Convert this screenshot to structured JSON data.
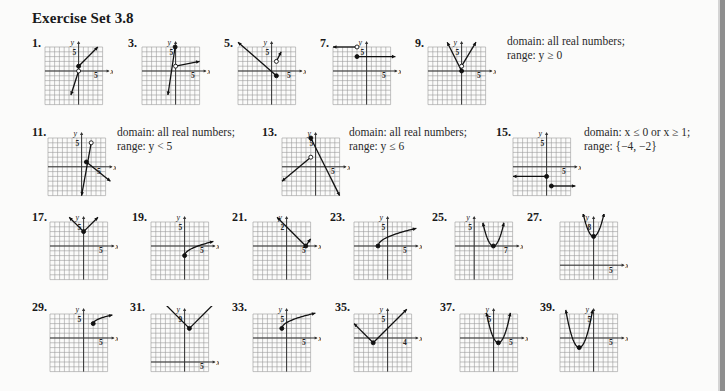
{
  "page": {
    "title": "Exercise Set 3.8"
  },
  "exercises": [
    {
      "num": "1.",
      "x": 32,
      "y": 36,
      "gx": 45,
      "gy": 47,
      "ylab": "5",
      "xlab": "5",
      "ox": 7,
      "oy": 7,
      "shapes": [
        {
          "t": "seg",
          "p": [
            [
              0,
              1
            ],
            [
              4,
              5
            ]
          ],
          "arrowEnd": true
        },
        {
          "t": "seg",
          "p": [
            [
              0,
              0
            ],
            [
              -1.6,
              -5
            ]
          ],
          "arrowEnd": true
        },
        {
          "t": "dot",
          "p": [
            0,
            1
          ],
          "filled": true
        },
        {
          "t": "dot",
          "p": [
            0,
            0
          ],
          "filled": false
        }
      ]
    },
    {
      "num": "3.",
      "x": 128,
      "y": 36,
      "gx": 142,
      "gy": 47,
      "ylab": "5",
      "xlab": "5",
      "ox": 7,
      "oy": 7,
      "shapes": [
        {
          "t": "seg",
          "p": [
            [
              0,
              1
            ],
            [
              5,
              2
            ]
          ],
          "arrowEnd": true
        },
        {
          "t": "seg",
          "p": [
            [
              -0.1,
              5
            ],
            [
              -1.6,
              -5
            ]
          ],
          "arrowEnd": true
        },
        {
          "t": "dot",
          "p": [
            -0.1,
            5
          ],
          "filled": true
        },
        {
          "t": "dot",
          "p": [
            0,
            1
          ],
          "filled": false
        }
      ]
    },
    {
      "num": "5.",
      "x": 224,
      "y": 36,
      "gx": 238,
      "gy": 47,
      "ylab": "5",
      "xlab": "5",
      "ox": 7,
      "oy": 7,
      "shapes": [
        {
          "t": "seg",
          "p": [
            [
              1,
              -1
            ],
            [
              -7,
              6
            ]
          ],
          "arrowEnd": true
        },
        {
          "t": "seg",
          "p": [
            [
              1,
              2
            ],
            [
              2,
              4
            ]
          ],
          "arrowEnd": true
        },
        {
          "t": "dot",
          "p": [
            1,
            -1
          ],
          "filled": true
        },
        {
          "t": "dot",
          "p": [
            1,
            2
          ],
          "filled": false
        }
      ]
    },
    {
      "num": "7.",
      "x": 320,
      "y": 36,
      "gx": 333,
      "gy": 47,
      "ylab": "5",
      "xlab": "5",
      "ox": 7,
      "oy": 7,
      "shapes": [
        {
          "t": "seg",
          "p": [
            [
              -2,
              5
            ],
            [
              -7,
              5
            ]
          ],
          "arrowEnd": true
        },
        {
          "t": "seg",
          "p": [
            [
              -2,
              3
            ],
            [
              6,
              3
            ]
          ],
          "arrowEnd": true
        },
        {
          "t": "dot",
          "p": [
            -2,
            5
          ],
          "filled": false
        },
        {
          "t": "dot",
          "p": [
            -2,
            3
          ],
          "filled": true
        }
      ]
    },
    {
      "num": "9.",
      "x": 415,
      "y": 36,
      "gx": 428,
      "gy": 47,
      "ylab": "5",
      "xlab": "5",
      "ox": 7,
      "oy": 7,
      "shapes": [
        {
          "t": "seg",
          "p": [
            [
              0,
              0
            ],
            [
              -3,
              6
            ]
          ],
          "arrowEnd": true
        },
        {
          "t": "seg",
          "p": [
            [
              0,
              1
            ],
            [
              3,
              6
            ]
          ],
          "arrowEnd": true
        },
        {
          "t": "dot",
          "p": [
            0,
            0
          ],
          "filled": true
        },
        {
          "t": "dot",
          "p": [
            0,
            1
          ],
          "filled": false
        }
      ]
    },
    {
      "num": "11.",
      "x": 32,
      "y": 125,
      "gx": 48,
      "gy": 138,
      "ylab": "5",
      "xlab": "5",
      "ox": 7,
      "oy": 6,
      "shapes": [
        {
          "t": "seg",
          "p": [
            [
              2,
              5
            ],
            [
              0,
              -6
            ]
          ],
          "arrowEnd": true
        },
        {
          "t": "seg",
          "p": [
            [
              1,
              1
            ],
            [
              6,
              -3
            ]
          ],
          "arrowEnd": true
        },
        {
          "t": "dot",
          "p": [
            2,
            5
          ],
          "filled": false
        },
        {
          "t": "dot",
          "p": [
            1,
            1
          ],
          "filled": true
        }
      ]
    },
    {
      "num": "13.",
      "x": 262,
      "y": 125,
      "gx": 282,
      "gy": 138,
      "ylab": "5",
      "xlab": "5",
      "ox": 7,
      "oy": 6,
      "shapes": [
        {
          "t": "seg",
          "p": [
            [
              -1,
              6
            ],
            [
              5,
              -6
            ]
          ],
          "arrowEnd": true
        },
        {
          "t": "seg",
          "p": [
            [
              -1,
              2
            ],
            [
              -7,
              -3
            ]
          ],
          "arrowEnd": true
        },
        {
          "t": "dot",
          "p": [
            -1,
            6
          ],
          "filled": true
        },
        {
          "t": "dot",
          "p": [
            -1,
            2
          ],
          "filled": false
        }
      ]
    },
    {
      "num": "15.",
      "x": 496,
      "y": 125,
      "gx": 513,
      "gy": 138,
      "ylab": "5",
      "xlab": "5",
      "ox": 7,
      "oy": 6,
      "shapes": [
        {
          "t": "seg",
          "p": [
            [
              0,
              -2
            ],
            [
              -7,
              -2
            ]
          ],
          "arrowEnd": true
        },
        {
          "t": "seg",
          "p": [
            [
              1,
              -4
            ],
            [
              6,
              -4
            ]
          ],
          "arrowEnd": true
        },
        {
          "t": "dot",
          "p": [
            0,
            -2
          ],
          "filled": true
        },
        {
          "t": "dot",
          "p": [
            1,
            -4
          ],
          "filled": true
        }
      ]
    },
    {
      "num": "17.",
      "x": 32,
      "y": 210,
      "gx": 50,
      "gy": 222,
      "ylab": "5",
      "xlab": "5",
      "ox": 7,
      "oy": 7,
      "shapes": [
        {
          "t": "seg",
          "p": [
            [
              0,
              3
            ],
            [
              -3,
              6
            ]
          ],
          "arrowEnd": true
        },
        {
          "t": "seg",
          "p": [
            [
              0,
              3
            ],
            [
              3,
              6
            ]
          ],
          "arrowEnd": true
        },
        {
          "t": "dot",
          "p": [
            0,
            3
          ],
          "filled": true
        }
      ]
    },
    {
      "num": "19.",
      "x": 132,
      "y": 210,
      "gx": 151,
      "gy": 222,
      "ylab": "5",
      "xlab": "5",
      "ox": 7,
      "oy": 7,
      "shapes": [
        {
          "t": "curve",
          "f": "sqrt",
          "x0": 0,
          "y0": -2,
          "k": 1.2,
          "x1": 6,
          "arrowEnd": true
        },
        {
          "t": "dot",
          "p": [
            0,
            -2
          ],
          "filled": true
        }
      ]
    },
    {
      "num": "21.",
      "x": 232,
      "y": 210,
      "gx": 253,
      "gy": 222,
      "ylab": "2",
      "xlab": "5",
      "ox": 7,
      "oy": 7,
      "shapes": [
        {
          "t": "seg",
          "p": [
            [
              4,
              0
            ],
            [
              -2,
              6
            ]
          ],
          "arrowEnd": true
        },
        {
          "t": "seg",
          "p": [
            [
              4,
              0
            ],
            [
              5,
              1.5
            ]
          ],
          "arrowEnd": true
        },
        {
          "t": "dot",
          "p": [
            4,
            0
          ],
          "filled": true
        }
      ]
    },
    {
      "num": "23.",
      "x": 330,
      "y": 210,
      "gx": 354,
      "gy": 222,
      "ylab": "5",
      "xlab": "5",
      "ox": 7,
      "oy": 7,
      "shapes": [
        {
          "t": "curve",
          "f": "sqrt",
          "x0": -2,
          "y0": 0,
          "k": 1.3,
          "x1": 6,
          "arrowEnd": true
        },
        {
          "t": "dot",
          "p": [
            -2,
            0
          ],
          "filled": true
        }
      ]
    },
    {
      "num": "25.",
      "x": 432,
      "y": 210,
      "gx": 455,
      "gy": 222,
      "ylab": "5",
      "xlab": "7",
      "ox": 4,
      "oy": 7,
      "shapes": [
        {
          "t": "curve",
          "f": "parab",
          "h": 4,
          "kk": 0,
          "a": 1,
          "x0": 1.8,
          "x1": 6.2,
          "arrowStart": true,
          "arrowEnd": true
        },
        {
          "t": "dot",
          "p": [
            4,
            0
          ],
          "filled": true
        }
      ]
    },
    {
      "num": "27.",
      "x": 527,
      "y": 210,
      "gx": 560,
      "gy": 222,
      "ylab": "8",
      "xlab": "5",
      "ox": 7,
      "oy": 3,
      "shapes": [
        {
          "t": "curve",
          "f": "parab",
          "h": 0,
          "kk": 6,
          "a": 1,
          "x0": -2.2,
          "x1": 2.2,
          "arrowStart": true,
          "arrowEnd": true
        },
        {
          "t": "dot",
          "p": [
            0,
            6
          ],
          "filled": true
        }
      ]
    },
    {
      "num": "29.",
      "x": 32,
      "y": 300,
      "gx": 50,
      "gy": 314,
      "ylab": "5",
      "xlab": "5",
      "ox": 7,
      "oy": 7,
      "shapes": [
        {
          "t": "curve",
          "f": "sqrt",
          "x0": 2,
          "y0": 3,
          "k": 0.9,
          "x1": 6,
          "arrowEnd": true
        },
        {
          "t": "dot",
          "p": [
            2,
            3
          ],
          "filled": true
        }
      ]
    },
    {
      "num": "31.",
      "x": 130,
      "y": 300,
      "gx": 151,
      "gy": 314,
      "ylab": "9",
      "xlab": "5",
      "ox": 7,
      "oy": 2,
      "shapes": [
        {
          "t": "seg",
          "p": [
            [
              1,
              7
            ],
            [
              -4.5,
              12.5
            ]
          ],
          "arrowEnd": true
        },
        {
          "t": "seg",
          "p": [
            [
              1,
              7
            ],
            [
              6.5,
              12.5
            ]
          ],
          "arrowEnd": true
        },
        {
          "t": "dot",
          "p": [
            1,
            7
          ],
          "filled": true
        }
      ]
    },
    {
      "num": "33.",
      "x": 232,
      "y": 300,
      "gx": 253,
      "gy": 314,
      "ylab": "5",
      "xlab": "5",
      "ox": 7,
      "oy": 7,
      "shapes": [
        {
          "t": "curve",
          "f": "sqrt",
          "x0": -1,
          "y0": 2,
          "k": 1.2,
          "x1": 6,
          "arrowEnd": true
        },
        {
          "t": "dot",
          "p": [
            -1,
            2
          ],
          "filled": true
        }
      ]
    },
    {
      "num": "35.",
      "x": 335,
      "y": 300,
      "gx": 354,
      "gy": 314,
      "ylab": "5",
      "xlab": "4",
      "ox": 7,
      "oy": 7,
      "shapes": [
        {
          "t": "seg",
          "p": [
            [
              -3,
              -1
            ],
            [
              -7,
              3
            ]
          ],
          "arrowEnd": true
        },
        {
          "t": "seg",
          "p": [
            [
              -3,
              -1
            ],
            [
              4,
              6
            ]
          ],
          "arrowEnd": true
        },
        {
          "t": "dot",
          "p": [
            -3,
            -1
          ],
          "filled": true
        }
      ]
    },
    {
      "num": "37.",
      "x": 440,
      "y": 300,
      "gx": 460,
      "gy": 314,
      "ylab": "5",
      "xlab": "5",
      "ox": 7,
      "oy": 7,
      "shapes": [
        {
          "t": "curve",
          "f": "parab",
          "h": 1,
          "kk": -1,
          "a": 1,
          "x0": -1.5,
          "x1": 3.5,
          "arrowStart": true,
          "arrowEnd": true
        },
        {
          "t": "dot",
          "p": [
            1,
            -1
          ],
          "filled": true
        }
      ]
    },
    {
      "num": "39.",
      "x": 540,
      "y": 300,
      "gx": 560,
      "gy": 314,
      "ylab": "5",
      "xlab": "5",
      "ox": 7,
      "oy": 7,
      "shapes": [
        {
          "t": "curve",
          "f": "parab",
          "h": -3,
          "kk": -2,
          "a": 1,
          "x0": -5.8,
          "x1": -0.2,
          "arrowStart": true,
          "arrowEnd": true
        },
        {
          "t": "dot",
          "p": [
            -3,
            -2
          ],
          "filled": true
        }
      ]
    }
  ],
  "answers": [
    {
      "id": "ans-9",
      "x": 507,
      "y": 34,
      "lines": [
        "domain: all real numbers;",
        "range: y ≥ 0"
      ]
    },
    {
      "id": "ans-11",
      "x": 117,
      "y": 125,
      "lines": [
        "domain: all real numbers;",
        "range: y < 5"
      ]
    },
    {
      "id": "ans-13",
      "x": 349,
      "y": 125,
      "lines": [
        "domain: all real numbers;",
        "range: y ≤ 6"
      ]
    },
    {
      "id": "ans-15",
      "x": 584,
      "y": 125,
      "lines": [
        "domain: x ≤ 0 or x ≥ 1;",
        "range: {−4, −2}"
      ]
    }
  ],
  "axis": {
    "x_label": "x",
    "y_label": "y"
  },
  "colors": {
    "grid": "#9a9a9a",
    "axis": "#333333",
    "curve": "#111111",
    "background": "#fbfbfa"
  }
}
